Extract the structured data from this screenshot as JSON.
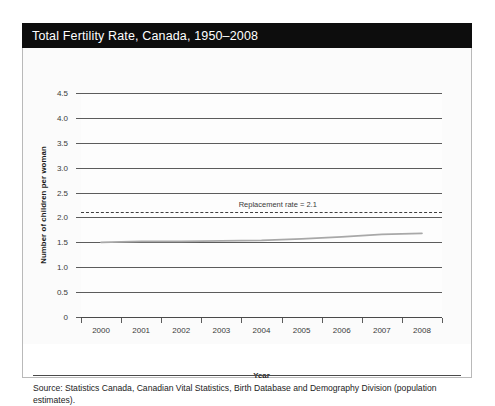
{
  "figure": {
    "title": "Total Fertility Rate, Canada, 1950–2008",
    "source": "Source: Statistics Canada, Canadian Vital Statistics, Birth Database and Demography Division (population estimates)."
  },
  "chart_data": {
    "type": "line",
    "title": "Total Fertility Rate, Canada, 1950–2008",
    "xlabel": "Year",
    "ylabel": "Number of children per woman",
    "categories": [
      "2000",
      "2001",
      "2002",
      "2003",
      "2004",
      "2005",
      "2006",
      "2007",
      "2008"
    ],
    "x": [
      2000,
      2001,
      2002,
      2003,
      2004,
      2005,
      2006,
      2007,
      2008
    ],
    "series": [
      {
        "name": "Total fertility rate",
        "values": [
          1.5,
          1.52,
          1.52,
          1.53,
          1.54,
          1.57,
          1.61,
          1.66,
          1.68
        ],
        "color": "#a8a8a8"
      }
    ],
    "ylim": [
      0,
      4.5
    ],
    "yticks": [
      0,
      0.5,
      1.0,
      1.5,
      2.0,
      2.5,
      3.0,
      3.5,
      4.0,
      4.5
    ],
    "ytick_labels": [
      "0",
      "0.5",
      "1.0",
      "1.5",
      "2.0",
      "2.5",
      "3.0",
      "3.5",
      "4.0",
      "4.5"
    ],
    "grid": true,
    "legend": "none",
    "annotations": [
      {
        "name": "replacement-rate",
        "label": "Replacement rate = 2.1",
        "value": 2.1,
        "style": "dashed",
        "color": "#3f3f3f"
      }
    ]
  },
  "colors": {
    "title_bar": "#0d0d0d",
    "title_text": "#ffffff",
    "grid": "#5c5c5c",
    "series": "#a8a8a8",
    "frame": "#b9b9b9"
  }
}
